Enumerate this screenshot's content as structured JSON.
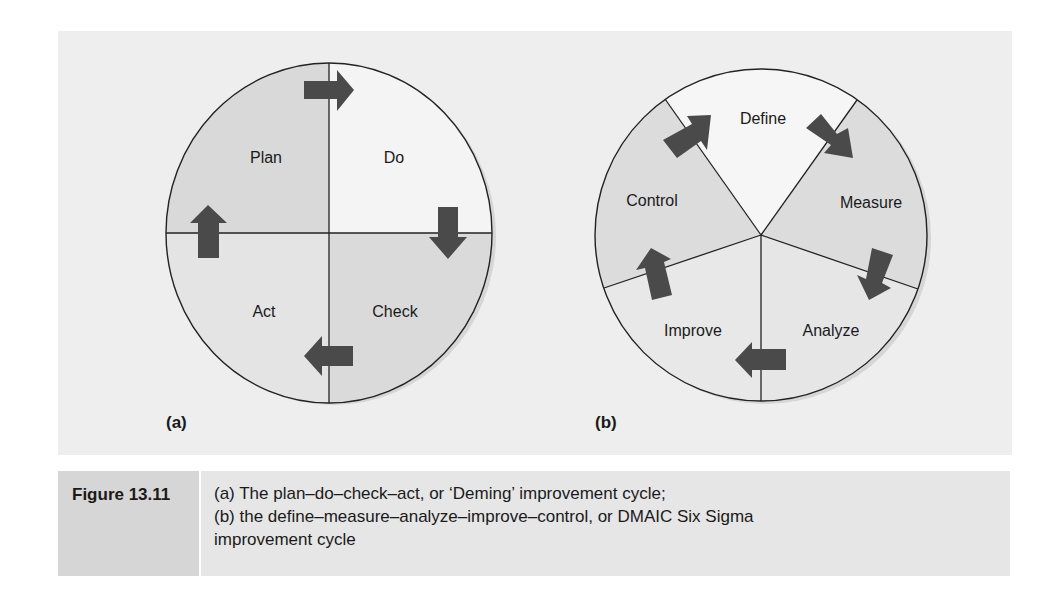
{
  "figure_a": {
    "label": "(a)",
    "segments": [
      {
        "name": "Plan",
        "fill": "#d9d9d9"
      },
      {
        "name": "Do",
        "fill": "#f4f4f4"
      },
      {
        "name": "Check",
        "fill": "#dadada"
      },
      {
        "name": "Act",
        "fill": "#e4e4e4"
      }
    ]
  },
  "figure_b": {
    "label": "(b)",
    "segments": [
      {
        "name": "Define",
        "fill": "#f6f6f6"
      },
      {
        "name": "Measure",
        "fill": "#dcdcdc"
      },
      {
        "name": "Analyze",
        "fill": "#e6e6e6"
      },
      {
        "name": "Improve",
        "fill": "#e8e8e8"
      },
      {
        "name": "Control",
        "fill": "#dcdcdc"
      }
    ]
  },
  "colors": {
    "background_panel": "#eeeeee",
    "arrow": "#4a4a4a",
    "line": "#222222",
    "caption_label_bg": "#d6d6d6",
    "caption_text_bg": "#e6e6e6"
  },
  "caption": {
    "label": "Figure 13.11",
    "lines": [
      "(a) The plan–do–check–act, or ‘Deming’ improvement cycle;",
      "(b) the define–measure–analyze–improve–control, or DMAIC Six Sigma",
      "improvement cycle"
    ]
  }
}
